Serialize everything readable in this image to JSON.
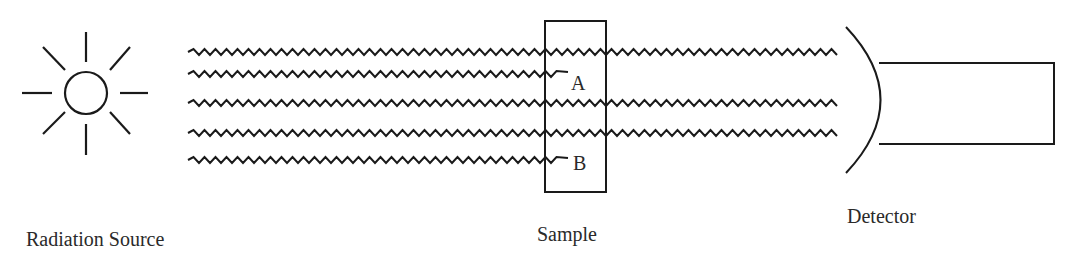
{
  "diagram": {
    "type": "spectroscopy-setup",
    "labels": {
      "source": "Radiation Source",
      "sample": "Sample",
      "detector": "Detector",
      "region_a": "A",
      "region_b": "B"
    },
    "beams": [
      {
        "id": 1,
        "y": 52,
        "x_start": 188,
        "x_end": 840,
        "absorbed": false
      },
      {
        "id": 2,
        "y": 74,
        "x_start": 188,
        "x_end": 560,
        "absorbed": true,
        "absorbed_at": "A"
      },
      {
        "id": 3,
        "y": 103,
        "x_start": 188,
        "x_end": 840,
        "absorbed": false
      },
      {
        "id": 4,
        "y": 133,
        "x_start": 188,
        "x_end": 840,
        "absorbed": false
      },
      {
        "id": 5,
        "y": 160,
        "x_start": 188,
        "x_end": 560,
        "absorbed": true,
        "absorbed_at": "B"
      }
    ],
    "colors": {
      "stroke": "#1a1a1a",
      "text": "#2a2a2a",
      "background": "#ffffff"
    }
  }
}
